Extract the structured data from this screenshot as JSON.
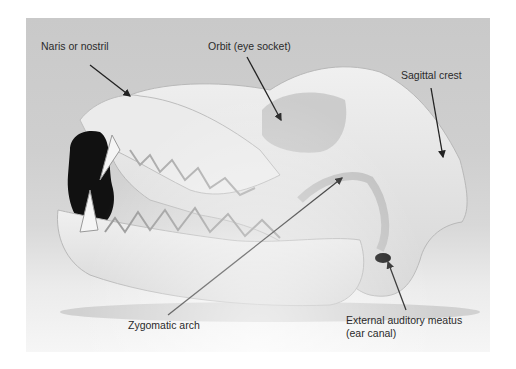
{
  "figure": {
    "labels": [
      {
        "id": "naris",
        "text": "Naris or nostril"
      },
      {
        "id": "orbit",
        "text": "Orbit (eye socket)"
      },
      {
        "id": "sagittal",
        "text": "Sagittal crest"
      },
      {
        "id": "zygomatic",
        "text": "Zygomatic arch"
      },
      {
        "id": "auditory",
        "text": "External auditory meatus",
        "text2": "(ear canal)"
      }
    ],
    "colors": {
      "background": "#c9c9c9",
      "bone": "#e6e6e6",
      "shadow": "#111111",
      "label_text": "#2a2a2a",
      "arrow": "#222222"
    }
  }
}
